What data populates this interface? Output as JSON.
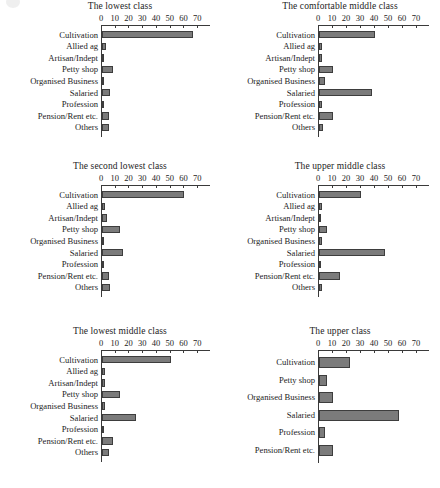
{
  "figure": {
    "axis_max": 75,
    "axis_ticks": [
      0,
      10,
      20,
      30,
      40,
      50,
      60,
      70
    ],
    "bar_color": "#7b7b7b",
    "bar_border_color": "#3d3d3d",
    "axis_color": "#3a3a3a"
  },
  "chart_data": [
    {
      "type": "bar",
      "orientation": "horizontal",
      "title": "The lowest class",
      "xlabel": "",
      "ylabel": "",
      "xlim": [
        0,
        75
      ],
      "xticks": [
        0,
        10,
        20,
        30,
        40,
        50,
        60,
        70
      ],
      "grid": false,
      "legend": "none",
      "categories": [
        "Cultivation",
        "Allied ag",
        "Artisan/Indept",
        "Petty shop",
        "Organised Business",
        "Salaried",
        "Profession",
        "Pension/Rent etc.",
        "Others"
      ],
      "values": [
        66,
        3,
        1.5,
        8,
        1,
        6,
        1,
        5,
        5
      ]
    },
    {
      "type": "bar",
      "orientation": "horizontal",
      "title": "The comfortable middle class",
      "xlabel": "",
      "ylabel": "",
      "xlim": [
        0,
        75
      ],
      "xticks": [
        0,
        10,
        20,
        30,
        40,
        50,
        60,
        70
      ],
      "grid": false,
      "legend": "none",
      "categories": [
        "Cultivation",
        "Allied ag",
        "Artisan/Indept",
        "Petty shop",
        "Organised Business",
        "Salaried",
        "Profession",
        "Pension/Rent etc.",
        "Others"
      ],
      "values": [
        40,
        2,
        2,
        10,
        4,
        38,
        2,
        10,
        3
      ]
    },
    {
      "type": "bar",
      "orientation": "horizontal",
      "title": "The second lowest class",
      "xlabel": "",
      "ylabel": "",
      "xlim": [
        0,
        75
      ],
      "xticks": [
        0,
        10,
        20,
        30,
        40,
        50,
        60,
        70
      ],
      "grid": false,
      "legend": "none",
      "categories": [
        "Cultivation",
        "Allied ag",
        "Artisan/Indept",
        "Petty shop",
        "Organised Business",
        "Salaried",
        "Profession",
        "Pension/Rent etc.",
        "Others"
      ],
      "values": [
        60,
        2.5,
        4,
        13,
        1,
        15,
        1,
        5,
        6
      ]
    },
    {
      "type": "bar",
      "orientation": "horizontal",
      "title": "The upper middle class",
      "xlabel": "",
      "ylabel": "",
      "xlim": [
        0,
        75
      ],
      "xticks": [
        0,
        10,
        20,
        30,
        40,
        50,
        60,
        70
      ],
      "grid": false,
      "legend": "none",
      "categories": [
        "Cultivation",
        "Allied ag",
        "Artisan/Indept",
        "Petty shop",
        "Organised Business",
        "Salaried",
        "Profession",
        "Pension/Rent etc.",
        "Others"
      ],
      "values": [
        30,
        2,
        1,
        6,
        2,
        47,
        1.5,
        15,
        2
      ]
    },
    {
      "type": "bar",
      "orientation": "horizontal",
      "title": "The lowest middle class",
      "xlabel": "",
      "ylabel": "",
      "xlim": [
        0,
        75
      ],
      "xticks": [
        0,
        10,
        20,
        30,
        40,
        50,
        60,
        70
      ],
      "grid": false,
      "legend": "none",
      "categories": [
        "Cultivation",
        "Allied ag",
        "Artisan/Indept",
        "Petty shop",
        "Organised Business",
        "Salaried",
        "Profession",
        "Pension/Rent etc.",
        "Others"
      ],
      "values": [
        50,
        2,
        2,
        13,
        2,
        25,
        1,
        8,
        5
      ]
    },
    {
      "type": "bar",
      "orientation": "horizontal",
      "title": "The upper class",
      "xlabel": "",
      "ylabel": "",
      "xlim": [
        0,
        75
      ],
      "xticks": [
        0,
        10,
        20,
        30,
        40,
        50,
        60,
        70
      ],
      "grid": false,
      "legend": "none",
      "categories": [
        "Cultivation",
        "Petty shop",
        "Organised Business",
        "Salaried",
        "Profession",
        "Pension/Rent etc."
      ],
      "values": [
        22,
        6,
        10,
        57,
        4,
        10
      ]
    }
  ]
}
